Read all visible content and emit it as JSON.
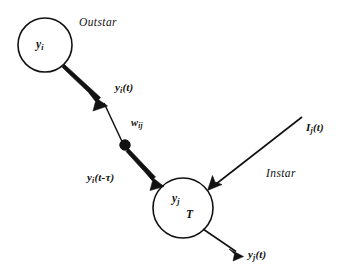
{
  "figure": {
    "type": "neural-network-outstar-instar-diagram",
    "background_color": "#ffffff",
    "stroke_color": "#121212",
    "canvas": {
      "width": 344,
      "height": 279
    }
  },
  "nodes": {
    "source": {
      "id": "y_i",
      "label_main": "y",
      "label_sub": "i",
      "cx": 45,
      "cy": 45,
      "r": 27
    },
    "target": {
      "id": "y_j",
      "label_main": "y",
      "label_sub": "j",
      "threshold_label": "T",
      "cx": 183,
      "cy": 208,
      "r": 30
    },
    "delay_dot": {
      "id": "delay-junction",
      "cx": 125,
      "cy": 145,
      "r": 5.2
    }
  },
  "regions": {
    "outstar": "Outstar",
    "instar": "Instar"
  },
  "signals": {
    "pre_delay": {
      "main": "y",
      "sub": "i",
      "arg": "(t)"
    },
    "weight": {
      "main": "w",
      "sub": "ij"
    },
    "post_delay": {
      "main": "y",
      "sub": "i",
      "arg": "(t-τ)"
    },
    "external_input": {
      "main": "I",
      "sub": "j",
      "arg": "(t)"
    },
    "output": {
      "main": "y",
      "sub": "j",
      "arg": "(t)"
    }
  },
  "edges": [
    {
      "name": "outstar-segment-1",
      "from": "y_i",
      "to": "delay-junction",
      "style": "tapered-thick",
      "arrowhead": true,
      "label": "y_i(t)"
    },
    {
      "name": "outstar-segment-2",
      "from": "delay-junction",
      "to": "y_j",
      "style": "tapered-thick",
      "arrowhead": true,
      "label": "y_i(t-τ)"
    },
    {
      "name": "instar-input-edge",
      "from": "I_j(t)",
      "to": "y_j",
      "style": "thin",
      "arrowhead": true,
      "label": "I_j(t)"
    },
    {
      "name": "output-edge",
      "from": "y_j",
      "to": "y_j(t)",
      "style": "thin",
      "arrowhead": true,
      "label": "y_j(t)"
    }
  ]
}
